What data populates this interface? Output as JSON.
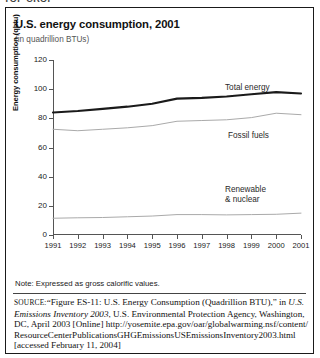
{
  "top_cropped_line": "TOP CROP",
  "figure": {
    "title": "U.S. energy consumption, 2001",
    "subtitle": "(in quadrillion BTUs)",
    "note": "Note: Expressed as gross calorific values."
  },
  "source": {
    "label": "SOURCE:",
    "part1": "“Figure ES-11: U.S. Energy Consumption (Quadrillion BTU),” in ",
    "italic1": "U.S. Emissions Inventory 2003",
    "part2": ", U.S. Environmental Protection Agency, Washington, DC, April 2003 [Online] ",
    "url": "http://yosemite.epa.gov/oar/globalwarming.nsf/content/ResourceCenterPublicationsGHGEmissionsUSEmissionsInventory2003.html",
    "part3": " [accessed February 11, 2004]"
  },
  "chart_data": {
    "type": "line",
    "title": "U.S. energy consumption, 2001",
    "subtitle": "(in quadrillion BTUs)",
    "xlabel": "",
    "ylabel": "Energy consumption (qbtu)",
    "ylim": [
      0,
      120
    ],
    "yticks": [
      0,
      20,
      40,
      60,
      80,
      100,
      120
    ],
    "grid": false,
    "legend_position": "inline-right",
    "categories": [
      1991,
      1992,
      1993,
      1994,
      1995,
      1996,
      1997,
      1998,
      1999,
      2000,
      2001
    ],
    "x": [
      "1991",
      "1992",
      "1993",
      "1994",
      "1995",
      "1996",
      "1997",
      "1998",
      "1999",
      "2000",
      "2001"
    ],
    "series": [
      {
        "name": "Total energy",
        "color": "#1a1a1a",
        "values": [
          84.0,
          85.0,
          86.5,
          88.0,
          90.0,
          93.5,
          94.0,
          95.0,
          96.5,
          98.0,
          97.0
        ]
      },
      {
        "name": "Fossil fuels",
        "color": "#aaaaaa",
        "values": [
          72.5,
          71.5,
          72.5,
          73.5,
          75.0,
          78.0,
          78.5,
          79.0,
          80.5,
          83.5,
          82.5
        ]
      },
      {
        "name": "Renewable & nuclear",
        "color": "#aaaaaa",
        "values": [
          11.5,
          11.8,
          12.0,
          12.5,
          13.0,
          14.0,
          14.0,
          13.8,
          14.0,
          14.2,
          15.0
        ]
      }
    ]
  }
}
